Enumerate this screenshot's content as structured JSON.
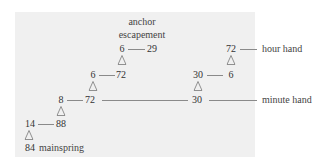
{
  "diagram": {
    "title_lines": [
      "anchor",
      "escapement"
    ],
    "labels": {
      "hour_hand": "hour hand",
      "minute_hand": "minute hand",
      "mainspring": "mainspring"
    },
    "gear_train": [
      {
        "pinion": "6",
        "wheel": "29",
        "note": "escapement"
      },
      {
        "pinion": "6",
        "wheel": "72"
      },
      {
        "pinion": "8",
        "wheel": "72"
      },
      {
        "pinion": "14",
        "wheel": "88"
      },
      {
        "wheel": "84",
        "note": "mainspring"
      }
    ],
    "motion_work": [
      {
        "pinion": "30",
        "wheel": "6"
      },
      {
        "wheel": "72",
        "note": "hour hand"
      },
      {
        "wheel": "30",
        "note": "minute hand"
      }
    ],
    "nodes": {
      "esc_pinion": "6",
      "esc_wheel": "29",
      "third_pinion": "6",
      "third_wheel": "72",
      "center_pinion": "8",
      "center_wheel": "72",
      "second_pinion": "14",
      "second_wheel": "88",
      "barrel": "84",
      "hour_wheel": "72",
      "minute_pinion_wheel": "30",
      "minute_pinion": "6",
      "cannon": "30"
    },
    "colors": {
      "panel": "#f0f0f0",
      "text": "#333333",
      "line": "#8a8a8a"
    }
  }
}
